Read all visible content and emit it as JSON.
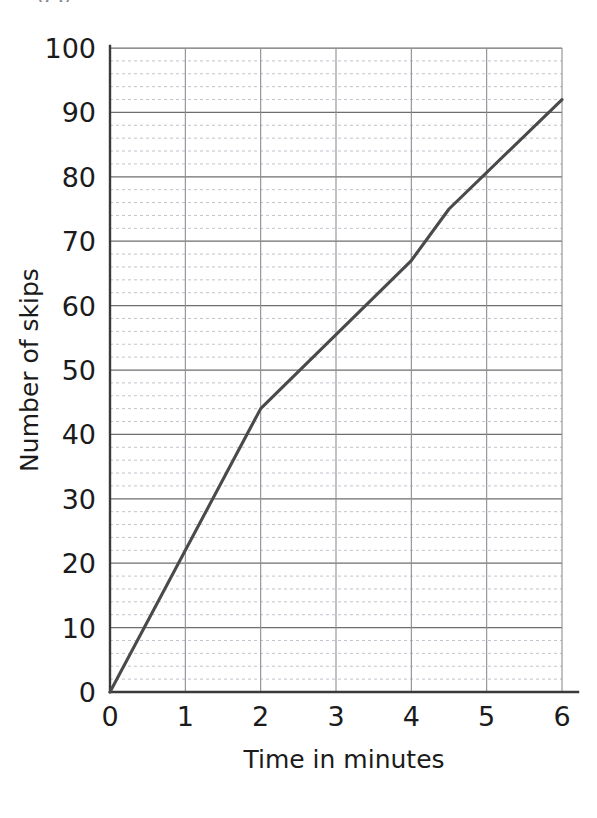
{
  "page": {
    "background_color": "#ffffff",
    "top_crop_artifact": "g p"
  },
  "chart_data": {
    "type": "line",
    "title": "",
    "xlabel": "Time in minutes",
    "ylabel": "Number of skips",
    "xlim": [
      0,
      6
    ],
    "ylim": [
      0,
      100
    ],
    "x_ticks": [
      0,
      1,
      2,
      3,
      4,
      5,
      6
    ],
    "x_tick_labels": [
      "0",
      "1",
      "2",
      "3",
      "4",
      "5",
      "6"
    ],
    "y_ticks": [
      0,
      10,
      20,
      30,
      40,
      50,
      60,
      70,
      80,
      90,
      100
    ],
    "y_tick_labels": [
      "0",
      "10",
      "20",
      "30",
      "40",
      "50",
      "60",
      "70",
      "80",
      "90",
      "100"
    ],
    "y_minor_step": 2,
    "x_minor_step": 1,
    "grid": {
      "horizontal_major": true,
      "horizontal_minor_dotted": true,
      "vertical_major": true,
      "vertical_minor": false
    },
    "legend": null,
    "legend_position": "none",
    "series": [
      {
        "name": "Number of skips",
        "color": "#4a4a4a",
        "points": [
          {
            "x": 0,
            "y": 0
          },
          {
            "x": 2,
            "y": 44
          },
          {
            "x": 4,
            "y": 67
          },
          {
            "x": 4.5,
            "y": 75
          },
          {
            "x": 6,
            "y": 92
          }
        ]
      }
    ],
    "annotations": []
  },
  "colors": {
    "line": "#4a4a4a",
    "axis": "#3a3a3a",
    "grid_major": "#6e6e6e",
    "grid_vertical": "#8d8d96",
    "grid_minor": "#c2b9c6",
    "text": "#1b1b1b"
  }
}
